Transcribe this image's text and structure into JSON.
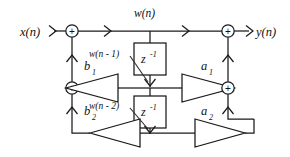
{
  "diagram": {
    "background_color": "#ffffff",
    "line_color": "#1a1a1a",
    "signals": {
      "input": "x(n)",
      "output": "y(n)",
      "state": "w(n)",
      "state_delay_1": "w(n - 1)",
      "state_delay_2": "w(n - 2)"
    },
    "delay_blocks": [
      {
        "id": "delay-1",
        "symbol": "z",
        "exponent": "-1"
      },
      {
        "id": "delay-2",
        "symbol": "z",
        "exponent": "-1"
      }
    ],
    "gains": [
      {
        "id": "gain-b1",
        "label": "b",
        "subscript": "1",
        "direction": "left"
      },
      {
        "id": "gain-b2",
        "label": "b",
        "subscript": "2",
        "direction": "left"
      },
      {
        "id": "gain-a1",
        "label": "a",
        "subscript": "1",
        "direction": "right"
      },
      {
        "id": "gain-a2",
        "label": "a",
        "subscript": "2",
        "direction": "right"
      }
    ],
    "adders": [
      {
        "id": "adder-input",
        "symbol": "+"
      },
      {
        "id": "adder-feedback-1",
        "symbol": "+"
      },
      {
        "id": "adder-output",
        "symbol": "+"
      },
      {
        "id": "adder-feedforward-1",
        "symbol": "+"
      }
    ]
  }
}
